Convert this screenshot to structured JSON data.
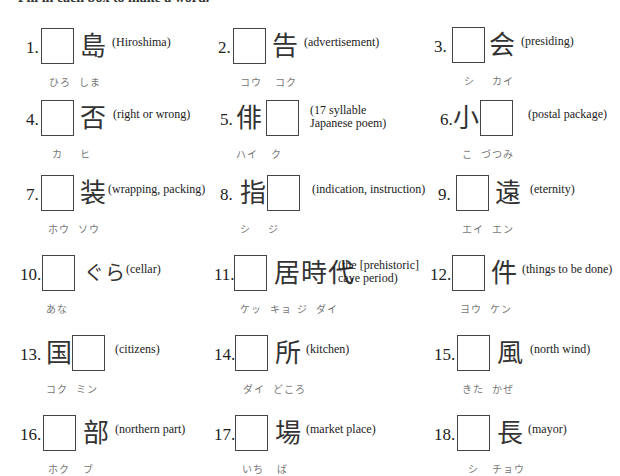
{
  "instruction": "Fill in each box to make a word.",
  "items": [
    {
      "num": "1.",
      "before": "",
      "after": "島",
      "meaning": "(Hiroshima)",
      "meaning2": "",
      "reading": "ひろ  しま"
    },
    {
      "num": "2.",
      "before": "",
      "after": "告",
      "meaning": "(advertisement)",
      "meaning2": "",
      "reading": "コウ   コク"
    },
    {
      "num": "3.",
      "before": "",
      "after": "会",
      "meaning": "(presiding)",
      "meaning2": "",
      "reading": "シ    カイ"
    },
    {
      "num": "4.",
      "before": "",
      "after": "否",
      "meaning": "(right or wrong)",
      "meaning2": "",
      "reading": "カ    ヒ"
    },
    {
      "num": "5.",
      "before": "俳",
      "after": "",
      "meaning": "(17 syllable",
      "meaning2": "Japanese poem)",
      "reading": "ハイ   ク"
    },
    {
      "num": "6.",
      "before": "小",
      "after": "",
      "meaning": "(postal package)",
      "meaning2": "",
      "reading": "こ  づつみ"
    },
    {
      "num": "7.",
      "before": "",
      "after": "装",
      "meaning": "(wrapping, packing)",
      "meaning2": "",
      "reading": "ホウ  ソウ"
    },
    {
      "num": "8.",
      "before": "指",
      "after": "",
      "meaning": "(indication, instruction)",
      "meaning2": "",
      "reading": "シ    ジ"
    },
    {
      "num": "9.",
      "before": "",
      "after": "遠",
      "meaning": "(eternity)",
      "meaning2": "",
      "reading": "エイ  エン"
    },
    {
      "num": "10.",
      "before": "",
      "after": "ぐら",
      "meaning": "(cellar)",
      "meaning2": "",
      "reading": "あな"
    },
    {
      "num": "11.",
      "before": "",
      "after": "居時代",
      "meaning": "(the [prehistoric]",
      "meaning2": "cave period)",
      "reading": "ケッ  キョ ジ  ダイ"
    },
    {
      "num": "12.",
      "before": "",
      "after": "件",
      "meaning": "(things to be done)",
      "meaning2": "",
      "reading": "ヨウ  ケン"
    },
    {
      "num": "13.",
      "before": "国",
      "after": "",
      "meaning": "(citizens)",
      "meaning2": "",
      "reading": "コク  ミン"
    },
    {
      "num": "14.",
      "before": "",
      "after": "所",
      "meaning": "(kitchen)",
      "meaning2": "",
      "reading": "ダイ  どころ"
    },
    {
      "num": "15.",
      "before": "",
      "after": "風",
      "meaning": "(north wind)",
      "meaning2": "",
      "reading": "きた  かぜ"
    },
    {
      "num": "16.",
      "before": "",
      "after": "部",
      "meaning": "(northern part)",
      "meaning2": "",
      "reading": "ホク   ブ"
    },
    {
      "num": "17.",
      "before": "",
      "after": "場",
      "meaning": "(market place)",
      "meaning2": "",
      "reading": "いち   ば"
    },
    {
      "num": "18.",
      "before": "",
      "after": "長",
      "meaning": "(mayor)",
      "meaning2": "",
      "reading": "シ   チョウ"
    }
  ]
}
